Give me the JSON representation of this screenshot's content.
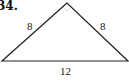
{
  "problem": {
    "number": "34."
  },
  "triangle": {
    "type": "isosceles",
    "sides": {
      "left": "8",
      "right": "8",
      "base": "12"
    },
    "apex_marker": "faint right-angle mark",
    "line_color": "#222222"
  }
}
